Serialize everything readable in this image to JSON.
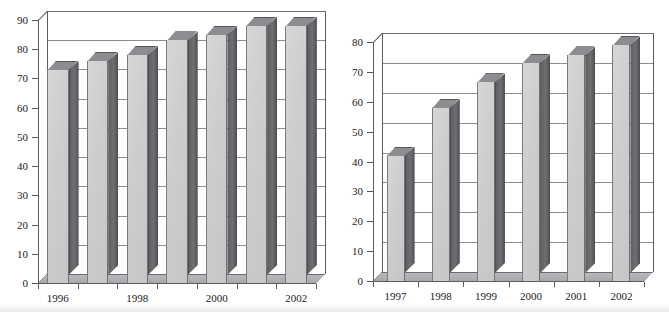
{
  "page": {
    "background": "#ffffff",
    "bar_face_color": "#cfcfcf",
    "bar_side_color": "#646469",
    "bar_top_color": "#8c8c91",
    "axis_color": "#5c5c61",
    "grid_color": "#8d8d92",
    "text_color": "#1a1a1a"
  },
  "chart_data": [
    {
      "id": "left",
      "type": "bar",
      "title": "",
      "subtitle": "",
      "xlabel": "",
      "ylabel": "",
      "categories": [
        "1996",
        "1997",
        "1998",
        "1999",
        "2000",
        "2001",
        "2002"
      ],
      "tick_labels_shown": [
        "1996",
        "",
        "1998",
        "",
        "2000",
        "",
        "2002"
      ],
      "values": [
        73,
        76,
        78,
        83,
        85,
        88,
        88
      ],
      "ylim": [
        0,
        90
      ],
      "ytick_values": [
        0,
        10,
        20,
        30,
        40,
        50,
        60,
        70,
        80,
        90
      ],
      "ytick_labels": [
        "0",
        "10",
        "20",
        "30",
        "40",
        "50",
        "60",
        "70",
        "80",
        "90"
      ],
      "grid": true,
      "legend": "none",
      "style": "3d-column"
    },
    {
      "id": "right",
      "type": "bar",
      "title": "",
      "subtitle": "",
      "xlabel": "",
      "ylabel": "",
      "categories": [
        "1997",
        "1998",
        "1999",
        "2000",
        "2001",
        "2002"
      ],
      "tick_labels_shown": [
        "1997",
        "1998",
        "1999",
        "2000",
        "2001",
        "2002"
      ],
      "values": [
        42,
        58,
        66.5,
        73,
        75.5,
        79
      ],
      "ylim": [
        0,
        80
      ],
      "ytick_values": [
        0,
        10,
        20,
        30,
        40,
        50,
        60,
        70,
        80
      ],
      "ytick_labels": [
        "0",
        "10",
        "20",
        "30",
        "40",
        "50",
        "60",
        "70",
        "80"
      ],
      "grid": true,
      "legend": "none",
      "style": "3d-column"
    }
  ]
}
